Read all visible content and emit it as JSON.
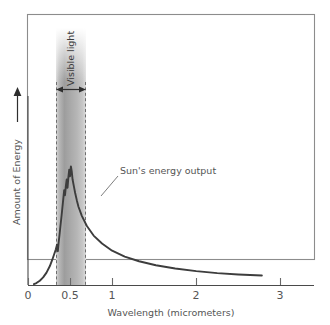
{
  "figure": {
    "kind": "scientific-figure",
    "background_color": "#ffffff",
    "frame_color": "#8c8c8c"
  },
  "chart_data": {
    "type": "line",
    "title": "",
    "subtitle": "",
    "xlabel": "Wavelength (micrometers)",
    "ylabel": "Amount of Energy",
    "ylabel_has_arrow": true,
    "grid": false,
    "legend": "none",
    "xlim": [
      0,
      3.4
    ],
    "ylim": [
      0,
      1.05
    ],
    "xticks": [
      0,
      0.5,
      1,
      2,
      3
    ],
    "xticklabels": [
      "0",
      "0.5",
      "1",
      "2",
      "3"
    ],
    "yticks": [],
    "yticklabels": [],
    "series": [
      {
        "name": "Sun's energy output",
        "color": "#3d3d3d",
        "x": [
          0.07,
          0.1,
          0.14,
          0.18,
          0.22,
          0.26,
          0.29,
          0.31,
          0.33,
          0.345,
          0.355,
          0.36,
          0.365,
          0.375,
          0.385,
          0.4,
          0.415,
          0.43,
          0.44,
          0.45,
          0.46,
          0.47,
          0.48,
          0.49,
          0.5,
          0.51,
          0.52,
          0.53,
          0.545,
          0.56,
          0.58,
          0.6,
          0.64,
          0.7,
          0.78,
          0.88,
          1.0,
          1.15,
          1.32,
          1.52,
          1.75,
          2.0,
          2.25,
          2.5,
          2.78
        ],
        "y": [
          0.005,
          0.012,
          0.026,
          0.046,
          0.075,
          0.115,
          0.155,
          0.185,
          0.215,
          0.245,
          0.205,
          0.235,
          0.262,
          0.305,
          0.355,
          0.425,
          0.5,
          0.575,
          0.545,
          0.6,
          0.64,
          0.59,
          0.655,
          0.7,
          0.66,
          0.72,
          0.69,
          0.64,
          0.6,
          0.56,
          0.515,
          0.475,
          0.42,
          0.358,
          0.3,
          0.252,
          0.208,
          0.172,
          0.144,
          0.12,
          0.1,
          0.084,
          0.072,
          0.064,
          0.058
        ]
      }
    ],
    "annotations": [
      {
        "name": "curve-callout",
        "text": "Sun's energy output",
        "points_to_x": 0.85,
        "points_to_y": 0.33
      }
    ],
    "bands": [
      {
        "name": "visible-light",
        "label": "Visible light",
        "x_start": 0.38,
        "x_end": 0.72,
        "orientation": "vertical",
        "edge_style": "dashed",
        "fill": "gray-gradient",
        "has_double_arrow": true
      }
    ]
  },
  "labels": {
    "y_axis_title": "Amount of Energy",
    "x_axis_title": "Wavelength (micrometers)",
    "band_title": "Visible light",
    "curve_annotation": "Sun's energy output"
  },
  "ticks": {
    "x": [
      "0",
      "0.5",
      "1",
      "2",
      "3"
    ]
  }
}
